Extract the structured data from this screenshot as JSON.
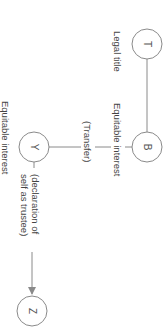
{
  "diagram": {
    "colors": {
      "stroke": "#8a8a8a",
      "node_fill": "#ffffff",
      "text": "#444444"
    },
    "nodes": [
      {
        "id": "T",
        "label": "T"
      },
      {
        "id": "B",
        "label": "B"
      },
      {
        "id": "Y",
        "label": "Y"
      },
      {
        "id": "Z",
        "label": "Z"
      }
    ],
    "edges": [
      {
        "from": "T",
        "to": "B",
        "label": "",
        "arrow": false
      },
      {
        "from": "B",
        "to": "Y",
        "label": "(Transfer)",
        "arrow": false
      },
      {
        "from": "Y",
        "to": "Z",
        "label": "(declaration of self as trustee)",
        "arrow": true
      }
    ],
    "labels": {
      "legal_title": "Legal title",
      "equitable_interest_b": "Equitable interest",
      "transfer": "(Transfer)",
      "equitable_interest_y": "Equitable interest",
      "declaration_line1": "(declaration of",
      "declaration_line2": "self as trustee)"
    }
  }
}
